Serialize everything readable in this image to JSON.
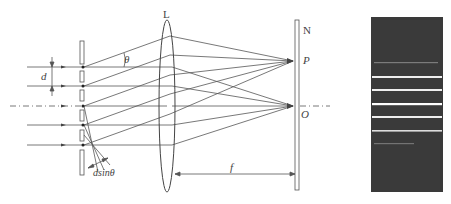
{
  "diagram": {
    "type": "diffraction-grating-optics",
    "labels": {
      "lens": "L",
      "screen": "N",
      "point_p": "P",
      "point_o": "O",
      "slit_spacing": "d",
      "angle": "θ",
      "path_difference": "dsinθ",
      "focal_length": "f"
    },
    "colors": {
      "line": "#555555",
      "pattern_background": "#3a3a3a",
      "fringe": "#e8e8e8"
    },
    "incident_rays_y": [
      67,
      86,
      106,
      125,
      145
    ],
    "fringes": [
      {
        "y": 63,
        "brightness": 0.45
      },
      {
        "y": 77,
        "brightness": 0.95
      },
      {
        "y": 90,
        "brightness": 0.95
      },
      {
        "y": 104,
        "brightness": 1.0
      },
      {
        "y": 117,
        "brightness": 0.95
      },
      {
        "y": 131,
        "brightness": 0.85
      },
      {
        "y": 144,
        "brightness": 0.35
      }
    ]
  }
}
